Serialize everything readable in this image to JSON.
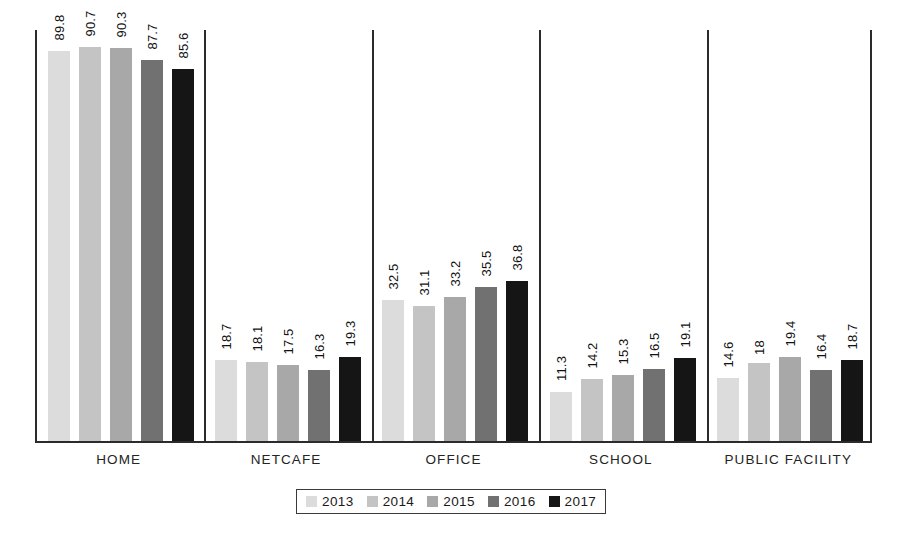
{
  "chart_data": {
    "type": "bar",
    "title": "",
    "subtitle": "",
    "xlabel": "",
    "ylabel": "",
    "ylim": [
      0,
      95
    ],
    "grid": false,
    "legend_position": "bottom",
    "categories": [
      "HOME",
      "NETCAFE",
      "OFFICE",
      "SCHOOL",
      "PUBLIC FACILITY"
    ],
    "series": [
      {
        "name": "2013",
        "color": "#dcdcdc",
        "values": [
          89.8,
          18.7,
          32.5,
          11.3,
          14.6
        ],
        "labels": [
          "89.8",
          "18.7",
          "32.5",
          "11.3",
          "14.6"
        ]
      },
      {
        "name": "2014",
        "color": "#c4c4c4",
        "values": [
          90.7,
          18.1,
          31.1,
          14.2,
          18
        ],
        "labels": [
          "90.7",
          "18.1",
          "31.1",
          "14.2",
          "18"
        ]
      },
      {
        "name": "2015",
        "color": "#a8a8a8",
        "values": [
          90.3,
          17.5,
          33.2,
          15.3,
          19.4
        ],
        "labels": [
          "90.3",
          "17.5",
          "33.2",
          "15.3",
          "19.4"
        ]
      },
      {
        "name": "2016",
        "color": "#717171",
        "values": [
          87.7,
          16.3,
          35.5,
          16.5,
          16.4
        ],
        "labels": [
          "87.7",
          "16.3",
          "35.5",
          "16.5",
          "16.4"
        ]
      },
      {
        "name": "2017",
        "color": "#151515",
        "values": [
          85.6,
          19.3,
          36.8,
          19.1,
          18.7
        ],
        "labels": [
          "85.6",
          "19.3",
          "36.8",
          "19.1",
          "18.7"
        ]
      }
    ]
  },
  "axis": {
    "frame_color": "#2b2b2b",
    "divider_color": "#2b2b2b"
  }
}
